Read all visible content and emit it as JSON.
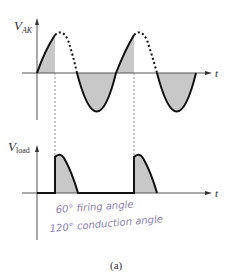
{
  "top_graph": {
    "y_label": "V",
    "y_label_sub": "AK",
    "x_label": "t"
  },
  "bottom_graph": {
    "y_label": "V",
    "y_label_sub": "load",
    "x_label": "t"
  },
  "annotations": {
    "line1": "60° firing angle",
    "line2": "120° conduction angle"
  },
  "caption": "(a)",
  "colors": {
    "stroke": "#111111",
    "shade": "#c8c8c8",
    "axis": "#555555",
    "handwriting": "#8c7fb0"
  }
}
